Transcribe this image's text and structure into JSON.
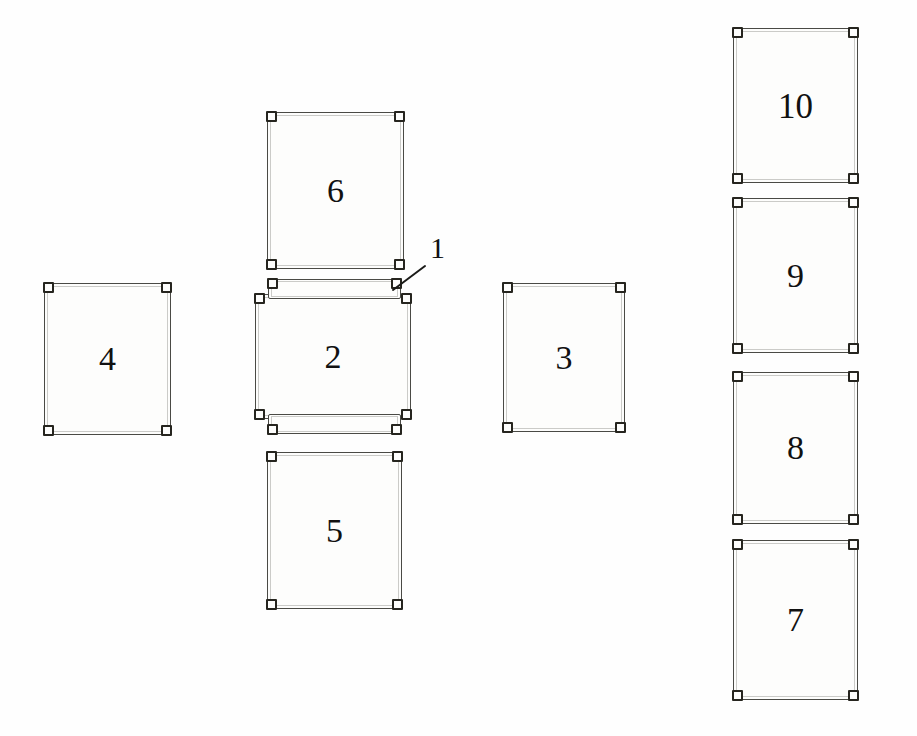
{
  "drawing": {
    "title": "Exploded panel layout drawing",
    "background_color": "#fefefe",
    "line_color": "#4a4a45",
    "corner_color": "#26251f",
    "text_color": "#111111",
    "width": 917,
    "height": 736
  },
  "panels": [
    {
      "id": "panel-4",
      "label": "4",
      "x": 44,
      "y": 283,
      "w": 127,
      "h": 152,
      "corner_count": 4
    },
    {
      "id": "panel-6",
      "label": "6",
      "x": 267,
      "y": 112,
      "w": 137,
      "h": 157,
      "corner_count": 4
    },
    {
      "id": "panel-2",
      "label": "2",
      "x": 255,
      "y": 294,
      "w": 156,
      "h": 125,
      "corner_count": 4
    },
    {
      "id": "panel-5",
      "label": "5",
      "x": 267,
      "y": 452,
      "w": 135,
      "h": 157,
      "corner_count": 4
    },
    {
      "id": "panel-3",
      "label": "3",
      "x": 503,
      "y": 283,
      "w": 122,
      "h": 149,
      "corner_count": 4
    },
    {
      "id": "panel-10",
      "label": "10",
      "x": 733,
      "y": 28,
      "w": 125,
      "h": 155,
      "corner_count": 4
    },
    {
      "id": "panel-9",
      "label": "9",
      "x": 733,
      "y": 198,
      "w": 125,
      "h": 155,
      "corner_count": 4
    },
    {
      "id": "panel-8",
      "label": "8",
      "x": 733,
      "y": 372,
      "w": 125,
      "h": 152,
      "corner_count": 4
    },
    {
      "id": "panel-7",
      "label": "7",
      "x": 733,
      "y": 540,
      "w": 125,
      "h": 160,
      "corner_count": 4
    }
  ],
  "flanges": [
    {
      "id": "flange-top",
      "x": 268,
      "y": 279,
      "w": 133,
      "h": 20
    },
    {
      "id": "flange-bottom",
      "x": 268,
      "y": 414,
      "w": 133,
      "h": 20
    }
  ],
  "callouts": [
    {
      "id": "callout-1",
      "label": "1",
      "label_x": 430,
      "label_y": 233,
      "leader_from_x": 425,
      "leader_from_y": 266,
      "leader_to_x": 393,
      "leader_to_y": 290
    }
  ]
}
